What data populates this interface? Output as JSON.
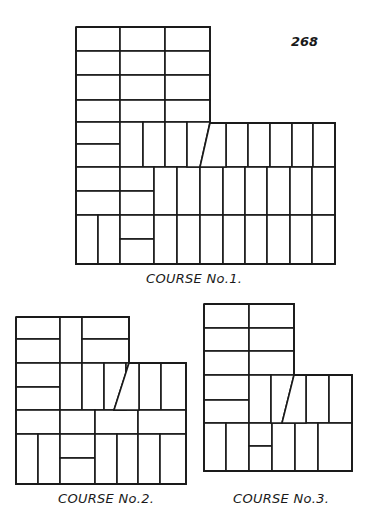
{
  "page_number": "268",
  "figures": [
    {
      "id": "course-1",
      "caption": "COURSE No.1.",
      "caption_pos": [
        146,
        283
      ],
      "outline": "76,27 210,27 210,123 335,123 335,264 76,264 76,27",
      "bricks": [
        [
          76,
          27,
          44,
          24
        ],
        [
          120,
          27,
          45,
          24
        ],
        [
          165,
          27,
          45,
          24
        ],
        [
          76,
          51,
          44,
          24
        ],
        [
          120,
          51,
          45,
          24
        ],
        [
          165,
          51,
          45,
          24
        ],
        [
          76,
          75,
          44,
          25
        ],
        [
          120,
          75,
          45,
          25
        ],
        [
          165,
          75,
          45,
          25
        ],
        [
          76,
          100,
          44,
          22
        ],
        [
          120,
          100,
          45,
          22
        ],
        [
          165,
          100,
          45,
          22
        ],
        [
          76,
          122,
          44,
          22
        ],
        [
          76,
          144,
          44,
          23
        ],
        [
          120,
          122,
          23,
          45
        ],
        [
          143,
          122,
          22,
          45
        ],
        [
          165,
          122,
          22,
          45
        ],
        [
          226,
          123,
          22,
          44
        ],
        [
          248,
          123,
          22,
          44
        ],
        [
          270,
          123,
          22,
          44
        ],
        [
          292,
          123,
          21,
          44
        ],
        [
          313,
          123,
          22,
          44
        ],
        [
          76,
          167,
          44,
          24
        ],
        [
          76,
          191,
          44,
          24
        ],
        [
          120,
          167,
          34,
          24
        ],
        [
          120,
          191,
          34,
          24
        ],
        [
          154,
          167,
          23,
          48
        ],
        [
          177,
          167,
          23,
          48
        ],
        [
          200,
          167,
          23,
          48
        ],
        [
          223,
          167,
          22,
          48
        ],
        [
          245,
          167,
          22,
          48
        ],
        [
          267,
          167,
          23,
          48
        ],
        [
          290,
          167,
          22,
          48
        ],
        [
          312,
          167,
          23,
          48
        ],
        [
          76,
          215,
          22,
          49
        ],
        [
          98,
          215,
          22,
          49
        ],
        [
          120,
          215,
          34,
          24
        ],
        [
          120,
          239,
          34,
          25
        ],
        [
          154,
          215,
          23,
          49
        ],
        [
          177,
          215,
          23,
          49
        ],
        [
          200,
          215,
          23,
          49
        ],
        [
          223,
          215,
          22,
          49
        ],
        [
          245,
          215,
          22,
          49
        ],
        [
          267,
          215,
          23,
          49
        ],
        [
          290,
          215,
          22,
          49
        ],
        [
          312,
          215,
          23,
          49
        ]
      ],
      "polys": [
        "187,122 210,122 200,167 187,167",
        "210,123 226,123 226,167 200,167"
      ]
    },
    {
      "id": "course-2",
      "caption": "COURSE No.2.",
      "caption_pos": [
        58,
        503
      ],
      "outline": "16,317 129,317 129,363 186,363 186,484 16,484 16,317",
      "bricks": [
        [
          16,
          317,
          44,
          22
        ],
        [
          16,
          339,
          44,
          24
        ],
        [
          60,
          317,
          22,
          46
        ],
        [
          82,
          317,
          47,
          22
        ],
        [
          82,
          339,
          47,
          24
        ],
        [
          16,
          363,
          44,
          24
        ],
        [
          16,
          387,
          44,
          23
        ],
        [
          60,
          363,
          22,
          47
        ],
        [
          82,
          363,
          22,
          47
        ],
        [
          104,
          363,
          22,
          47
        ],
        [
          139,
          363,
          22,
          47
        ],
        [
          161,
          363,
          25,
          47
        ],
        [
          16,
          410,
          44,
          24
        ],
        [
          60,
          410,
          35,
          24
        ],
        [
          95,
          410,
          43,
          24
        ],
        [
          138,
          410,
          48,
          24
        ],
        [
          16,
          434,
          22,
          50
        ],
        [
          38,
          434,
          22,
          50
        ],
        [
          60,
          434,
          35,
          24
        ],
        [
          60,
          458,
          35,
          26
        ],
        [
          95,
          434,
          22,
          50
        ],
        [
          117,
          434,
          21,
          50
        ],
        [
          138,
          434,
          22,
          50
        ],
        [
          160,
          434,
          26,
          50
        ]
      ],
      "polys": [
        "126,363 129,363 114,410 126,410",
        "129,363 139,363 139,410 114,410"
      ]
    },
    {
      "id": "course-3",
      "caption": "COURSE No.3.",
      "caption_pos": [
        233,
        503
      ],
      "outline": "204,304 294,304 294,375 352,375 352,471 204,471 204,304",
      "bricks": [
        [
          204,
          304,
          45,
          24
        ],
        [
          249,
          304,
          45,
          24
        ],
        [
          204,
          328,
          45,
          23
        ],
        [
          249,
          328,
          45,
          23
        ],
        [
          204,
          351,
          45,
          24
        ],
        [
          249,
          351,
          45,
          24
        ],
        [
          204,
          375,
          45,
          25
        ],
        [
          204,
          400,
          45,
          23
        ],
        [
          249,
          375,
          22,
          48
        ],
        [
          306,
          375,
          23,
          48
        ],
        [
          329,
          375,
          23,
          48
        ],
        [
          204,
          423,
          22,
          48
        ],
        [
          226,
          423,
          23,
          48
        ],
        [
          249,
          423,
          23,
          23
        ],
        [
          249,
          446,
          23,
          25
        ],
        [
          272,
          423,
          23,
          48
        ],
        [
          295,
          423,
          23,
          48
        ],
        [
          318,
          423,
          34,
          48
        ]
      ],
      "polys": [
        "271,375 294,375 282,423 271,423",
        "294,375 306,375 306,423 282,423"
      ]
    }
  ]
}
